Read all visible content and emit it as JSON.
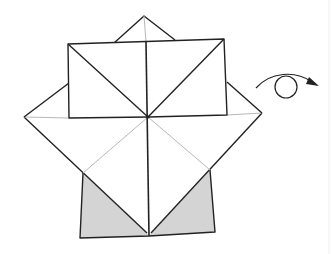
{
  "diagram": {
    "title": "",
    "type": "origami-fold-step",
    "colors": {
      "paper": "#ffffff",
      "shaded_back": "#d4d4d4",
      "edge": "#222222",
      "crease": "#b8b8b8"
    },
    "symbols": [
      {
        "name": "turn-over",
        "meaning": "Turn the model over"
      }
    ],
    "labels": []
  }
}
